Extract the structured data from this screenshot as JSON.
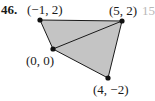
{
  "problem": {
    "number": "46.",
    "next_problem_fragment": "15"
  },
  "figure": {
    "type": "quadrilateral-with-diagonal",
    "fill_color": "#c4c4c4",
    "stroke_color": "#1a1a1a",
    "vertices": [
      {
        "id": "A",
        "label": "(−1, 2)",
        "x": -1,
        "y": 2
      },
      {
        "id": "B",
        "label": "(5, 2)",
        "x": 5,
        "y": 2
      },
      {
        "id": "C",
        "label": "(0, 0)",
        "x": 0,
        "y": 0
      },
      {
        "id": "D",
        "label": "(4, −2)",
        "x": 4,
        "y": -2
      }
    ],
    "edges": [
      [
        "A",
        "B"
      ],
      [
        "B",
        "D"
      ],
      [
        "D",
        "C"
      ],
      [
        "C",
        "A"
      ]
    ],
    "diagonal": [
      "C",
      "B"
    ]
  },
  "labels": {
    "a": "(−1, 2)",
    "b": "(5, 2)",
    "c": "(0, 0)",
    "d": "(4, −2)"
  }
}
